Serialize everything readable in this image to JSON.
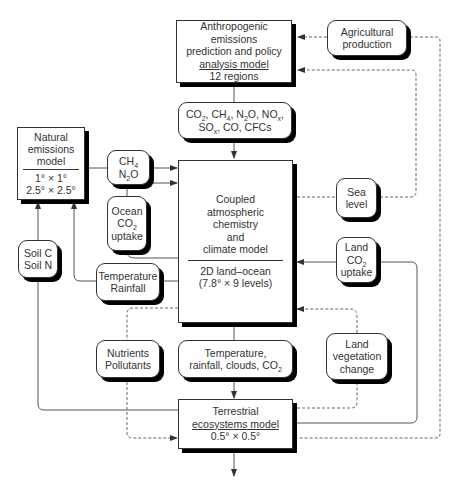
{
  "diagram": {
    "type": "flowchart",
    "nodes": {
      "anthropogenic": {
        "line1": "Anthropogenic emissions",
        "line2": "prediction and policy",
        "line3": "analysis model",
        "line4": "12 regions"
      },
      "agricultural": {
        "line1": "Agricultural",
        "line2": "production"
      },
      "gases": {
        "line1": "CO2, CH4, N2O, NOx,",
        "line2": "SOx, CO, CFCs"
      },
      "natural": {
        "line1": "Natural",
        "line2": "emissions",
        "line3": "model",
        "line4": "1° × 1°",
        "line5": "2.5° × 2.5°"
      },
      "ch4_n2o": {
        "line1": "CH4",
        "line2": "N2O"
      },
      "coupled": {
        "line1": "Coupled",
        "line2": "atmospheric",
        "line3": "chemistry",
        "line4": "and",
        "line5": "climate model",
        "line6": "2D land–ocean",
        "line7": "(7.8° × 9 levels)"
      },
      "ocean_uptake": {
        "line1": "Ocean",
        "line2": "CO2",
        "line3": "uptake"
      },
      "sea_level": {
        "line1": "Sea",
        "line2": "level"
      },
      "land_uptake": {
        "line1": "Land",
        "line2": "CO2",
        "line3": "uptake"
      },
      "soil": {
        "line1": "Soil C",
        "line2": "Soil N"
      },
      "temp_rain": {
        "line1": "Temperature",
        "line2": "Rainfall"
      },
      "nutrients": {
        "line1": "Nutrients",
        "line2": "Pollutants"
      },
      "climate_vars": {
        "line1": "Temperature,",
        "line2": "rainfall, clouds, CO2"
      },
      "land_veg": {
        "line1": "Land",
        "line2": "vegetation",
        "line3": "change"
      },
      "terrestrial": {
        "line1": "Terrestrial",
        "line2": "ecosystems model",
        "line3": "0.5° × 0.5°"
      }
    },
    "colors": {
      "line": "#333333",
      "shadow": "#000000",
      "background": "#ffffff"
    }
  }
}
